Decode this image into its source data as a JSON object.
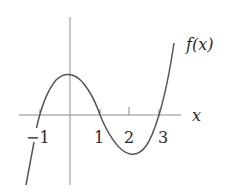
{
  "diagram": {
    "function_label": "f(x)",
    "axis_label_x": "x",
    "tick_labels": [
      {
        "value": -1,
        "text": "−1"
      },
      {
        "value": 1,
        "text": "1"
      },
      {
        "value": 2,
        "text": "2"
      },
      {
        "value": 3,
        "text": "3"
      }
    ],
    "function": "cubic with roots at -1, 1, 3",
    "roots": [
      -1,
      1,
      3
    ],
    "colors": {
      "curve": "#555555",
      "axes": "#8a8a8a",
      "text": "#2a2a2a",
      "background": "#ffffff"
    }
  }
}
